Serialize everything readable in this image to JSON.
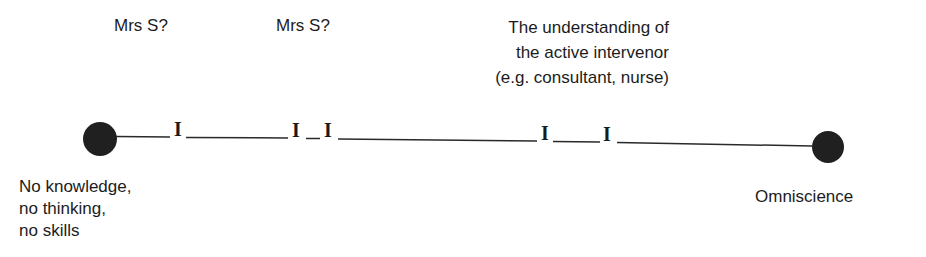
{
  "diagram": {
    "type": "continuum",
    "top_labels": [
      {
        "text": "Mrs S?"
      },
      {
        "text": "Mrs S?"
      },
      {
        "text": "The understanding of\nthe active intervenor\n(e.g. consultant, nurse)"
      }
    ],
    "left_endpoint": {
      "label": "No knowledge,\nno thinking,\nno skills"
    },
    "right_endpoint": {
      "label": "Omniscience"
    },
    "marker_glyph": "I",
    "colors": {
      "ink": "#1c1c1c",
      "dot": "#202020",
      "background": "#ffffff"
    }
  }
}
